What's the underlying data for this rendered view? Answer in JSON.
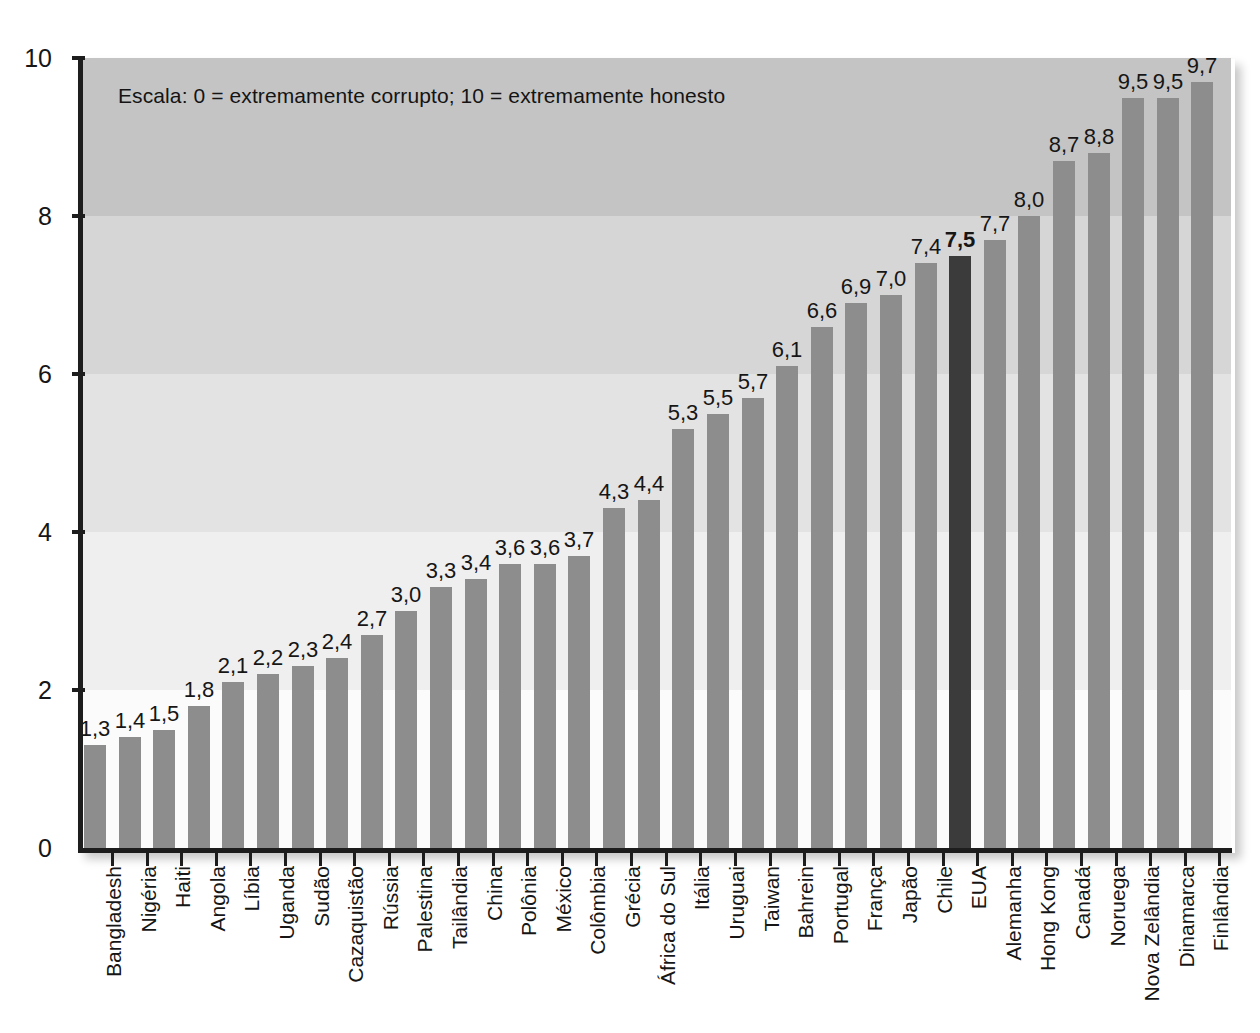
{
  "chart_data": {
    "type": "bar",
    "title": "",
    "subtitle": "",
    "annotation": "Escala: 0 = extremamente corrupto; 10 = extremamente honesto",
    "xlabel": "",
    "ylabel": "",
    "ylim": [
      0,
      10
    ],
    "yticks": [
      0,
      2,
      4,
      6,
      8,
      10
    ],
    "ytick_labels": [
      "0",
      "2",
      "4",
      "6",
      "8",
      "10"
    ],
    "grid": false,
    "legend": null,
    "highlight_category": "EUA",
    "colors": {
      "bar": "#8d8d8d",
      "bar_highlight": "#3b3b3b",
      "axis": "#1d1d1d",
      "text": "#161616",
      "band_0_2": "#fbfbfb",
      "band_2_4": "#efefef",
      "band_4_6": "#e3e3e3",
      "band_6_8": "#d6d6d6",
      "band_8_10": "#c4c4c4"
    },
    "categories": [
      "Bangladesh",
      "Nigéria",
      "Haiti",
      "Angola",
      "Líbia",
      "Uganda",
      "Sudão",
      "Cazaquistão",
      "Rússia",
      "Palestina",
      "Tailândia",
      "China",
      "Polônia",
      "México",
      "Colômbia",
      "Grécia",
      "África do Sul",
      "Itália",
      "Uruguai",
      "Taiwan",
      "Bahrein",
      "Portugal",
      "França",
      "Japão",
      "Chile",
      "EUA",
      "Alemanha",
      "Hong Kong",
      "Canadá",
      "Noruega",
      "Nova Zelândia",
      "Dinamarca",
      "Finlândia"
    ],
    "values": [
      1.3,
      1.4,
      1.5,
      1.8,
      2.1,
      2.2,
      2.3,
      2.4,
      2.7,
      3.0,
      3.3,
      3.4,
      3.6,
      3.6,
      3.7,
      4.3,
      4.4,
      5.3,
      5.5,
      5.7,
      6.1,
      6.6,
      6.9,
      7.0,
      7.4,
      7.5,
      7.7,
      8.0,
      8.7,
      8.8,
      9.5,
      9.5,
      9.7
    ],
    "value_labels": [
      "1,3",
      "1,4",
      "1,5",
      "1,8",
      "2,1",
      "2,2",
      "2,3",
      "2,4",
      "2,7",
      "3,0",
      "3,3",
      "3,4",
      "3,6",
      "3,6",
      "3,7",
      "4,3",
      "4,4",
      "5,3",
      "5,5",
      "5,7",
      "6,1",
      "6,6",
      "6,9",
      "7,0",
      "7,4",
      "7,5",
      "7,7",
      "8,0",
      "8,7",
      "8,8",
      "9,5",
      "9,5",
      "9,7"
    ]
  }
}
